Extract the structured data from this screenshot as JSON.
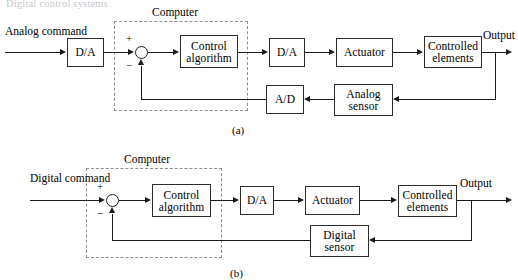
{
  "figure": {
    "cropped_caption": "Digital control systems",
    "panels": [
      {
        "id": "a",
        "label": "(a)",
        "computer_label": "Computer",
        "input_label_line1": "Analog",
        "input_label_line2": "command",
        "output_label": "Output",
        "plus_sign": "+",
        "minus_sign": "−",
        "blocks": {
          "input_converter": "D/A",
          "controller_line1": "Control",
          "controller_line2": "algorithm",
          "output_converter": "D/A",
          "actuator": "Actuator",
          "plant_line1": "Controlled",
          "plant_line2": "elements",
          "feedback_converter": "A/D",
          "sensor_line1": "Analog",
          "sensor_line2": "sensor"
        }
      },
      {
        "id": "b",
        "label": "(b)",
        "computer_label": "Computer",
        "input_label_line1": "Digital",
        "input_label_line2": "command",
        "output_label": "Output",
        "plus_sign": "+",
        "minus_sign": "−",
        "blocks": {
          "controller_line1": "Control",
          "controller_line2": "algorithm",
          "output_converter": "D/A",
          "actuator": "Actuator",
          "plant_line1": "Controlled",
          "plant_line2": "elements",
          "sensor_line1": "Digital",
          "sensor_line2": "sensor"
        }
      }
    ]
  },
  "colors": {
    "line": "#1a1a1a",
    "block_border": "#2b2b2b",
    "dashed_border": "#8d8d8d",
    "background": "#ffffff",
    "faded_text": "#c9c9c9"
  }
}
